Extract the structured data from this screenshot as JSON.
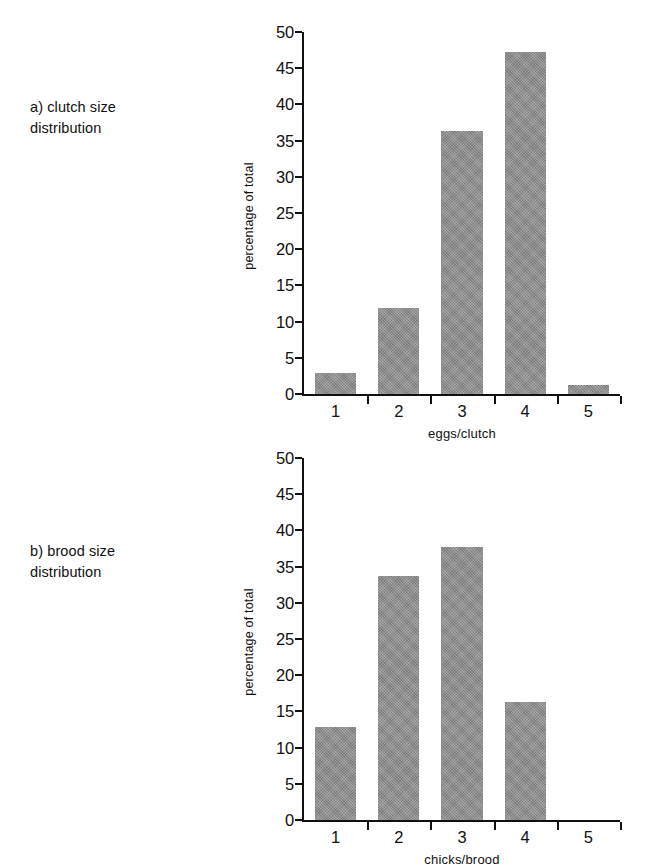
{
  "figure": {
    "panels": [
      {
        "caption": "a) clutch size\ndistribution",
        "caption_name": "panel-a-caption"
      },
      {
        "caption": "b) brood size\ndistribution",
        "caption_name": "panel-b-caption"
      }
    ],
    "bar_color": "#8a8a8a",
    "axis_color": "#111111"
  },
  "chart_data": [
    {
      "type": "bar",
      "panel": "a",
      "title": "",
      "categories": [
        "1",
        "2",
        "3",
        "4",
        "5"
      ],
      "values": [
        2.9,
        11.9,
        36.3,
        47.3,
        1.2
      ],
      "xlabel": "eggs/clutch",
      "ylabel": "percentage of total",
      "ylim": [
        0,
        50
      ],
      "yticks": [
        0,
        5,
        10,
        15,
        20,
        25,
        30,
        35,
        40,
        45,
        50
      ],
      "ytick_labels": [
        "0",
        "5",
        "10",
        "15",
        "20",
        "25",
        "30",
        "35",
        "40",
        "45",
        "50"
      ],
      "grid": false,
      "legend": "none"
    },
    {
      "type": "bar",
      "panel": "b",
      "title": "",
      "categories": [
        "1",
        "2",
        "3",
        "4",
        "5"
      ],
      "values": [
        12.9,
        33.7,
        37.7,
        16.3,
        0
      ],
      "xlabel": "chicks/brood",
      "ylabel": "percentage of total",
      "ylim": [
        0,
        50
      ],
      "yticks": [
        0,
        5,
        10,
        15,
        20,
        25,
        30,
        35,
        40,
        45,
        50
      ],
      "ytick_labels": [
        "0",
        "5",
        "10",
        "15",
        "20",
        "25",
        "30",
        "35",
        "40",
        "45",
        "50"
      ],
      "grid": false,
      "legend": "none"
    }
  ]
}
